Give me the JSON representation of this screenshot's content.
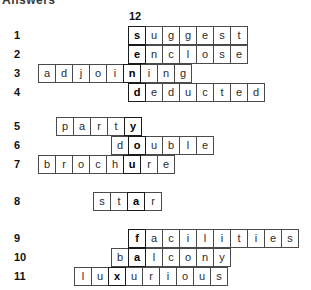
{
  "title": "Answers",
  "column_header": "12",
  "rows": [
    {
      "number": "1",
      "word": "suggest",
      "letters": [
        "s",
        "u",
        "g",
        "g",
        "e",
        "s",
        "t"
      ],
      "bold_index": 0,
      "left": 128,
      "top": 26
    },
    {
      "number": "2",
      "word": "enclose",
      "letters": [
        "e",
        "n",
        "c",
        "l",
        "o",
        "s",
        "e"
      ],
      "bold_index": 0,
      "left": 128,
      "top": 45
    },
    {
      "number": "3",
      "word": "adjoining",
      "letters": [
        "a",
        "d",
        "j",
        "o",
        "i",
        "n",
        "i",
        "n",
        "g"
      ],
      "bold_index": 5,
      "left": 38,
      "top": 64
    },
    {
      "number": "4",
      "word": "deducted",
      "letters": [
        "d",
        "e",
        "d",
        "u",
        "c",
        "t",
        "e",
        "d"
      ],
      "bold_index": 0,
      "left": 128,
      "top": 83
    },
    {
      "number": "5",
      "word": "party",
      "letters": [
        "p",
        "a",
        "r",
        "t",
        "y"
      ],
      "bold_index": 4,
      "left": 56,
      "top": 117
    },
    {
      "number": "6",
      "word": "double",
      "letters": [
        "d",
        "o",
        "u",
        "b",
        "l",
        "e"
      ],
      "bold_index": 1,
      "left": 111,
      "top": 136
    },
    {
      "number": "7",
      "word": "brochure",
      "letters": [
        "b",
        "r",
        "o",
        "c",
        "h",
        "u",
        "r",
        "e"
      ],
      "bold_index": 5,
      "left": 38,
      "top": 155
    },
    {
      "number": "8",
      "word": "star",
      "letters": [
        "s",
        "t",
        "a",
        "r"
      ],
      "bold_index": 2,
      "left": 93,
      "top": 192
    },
    {
      "number": "9",
      "word": "facilities",
      "letters": [
        "f",
        "a",
        "c",
        "i",
        "l",
        "i",
        "t",
        "i",
        "e",
        "s"
      ],
      "bold_index": 0,
      "left": 128,
      "top": 229
    },
    {
      "number": "10",
      "word": "balcony",
      "letters": [
        "b",
        "a",
        "l",
        "c",
        "o",
        "n",
        "y"
      ],
      "bold_index": 1,
      "left": 111,
      "top": 248
    },
    {
      "number": "11",
      "word": "luxurious",
      "letters": [
        "l",
        "u",
        "x",
        "u",
        "r",
        "i",
        "o",
        "u",
        "s"
      ],
      "bold_index": 2,
      "left": 74,
      "top": 267
    }
  ],
  "hidden_answer": "sendyouafax",
  "colors": {
    "page_background": "#ffffff",
    "cell_border": "#4a4a4a",
    "bold_cell_border": "#1a1a1a",
    "text": "#2b2b2b",
    "bold_text": "#000000"
  }
}
